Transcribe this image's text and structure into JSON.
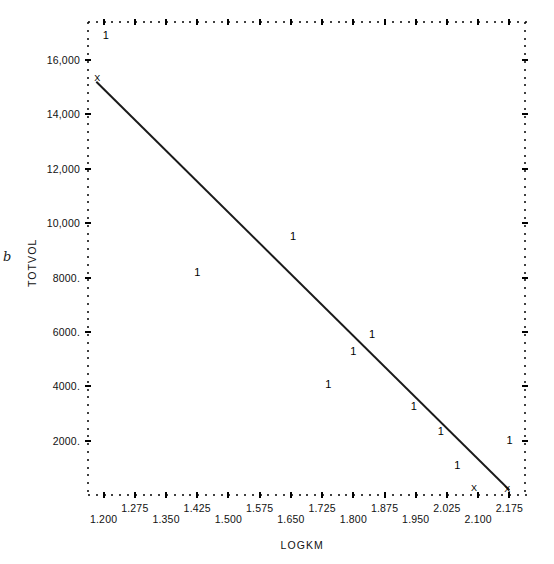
{
  "chart_data": {
    "type": "scatter",
    "title": "",
    "xlabel": "LOGKM",
    "ylabel": "TOTVOL",
    "xlim": [
      1.1625,
      2.2125
    ],
    "ylim": [
      0,
      17400
    ],
    "grid": false,
    "legend": null,
    "point_symbol": "1",
    "overlap_symbol": "X",
    "corner_label": "b",
    "xtick_labels": [
      "1.200",
      "1.275",
      "1.350",
      "1.425",
      "1.500",
      "1.575",
      "1.650",
      "1.725",
      "1.800",
      "1.875",
      "1.950",
      "2.025",
      "2.100",
      "2.175"
    ],
    "xtick_values": [
      1.2,
      1.275,
      1.35,
      1.425,
      1.5,
      1.575,
      1.65,
      1.725,
      1.8,
      1.875,
      1.95,
      2.025,
      2.1,
      2.175
    ],
    "ytick_labels": [
      "16,000",
      "14,000",
      "12,000",
      "10,000",
      "8000.",
      "6000.",
      "4000.",
      "2000."
    ],
    "ytick_values": [
      16000,
      14000,
      12000,
      10000,
      8000,
      6000,
      4000,
      2000
    ],
    "points": [
      {
        "x": 1.205,
        "y": 16900,
        "label": "1"
      },
      {
        "x": 1.185,
        "y": 15250,
        "label": "X"
      },
      {
        "x": 1.425,
        "y": 8150,
        "label": "1"
      },
      {
        "x": 1.655,
        "y": 9500,
        "label": "1"
      },
      {
        "x": 1.74,
        "y": 4050,
        "label": "1"
      },
      {
        "x": 1.8,
        "y": 5250,
        "label": "1"
      },
      {
        "x": 1.845,
        "y": 5900,
        "label": "1"
      },
      {
        "x": 1.945,
        "y": 3250,
        "label": "1"
      },
      {
        "x": 2.01,
        "y": 2300,
        "label": "1"
      },
      {
        "x": 2.05,
        "y": 1050,
        "label": "1"
      },
      {
        "x": 2.09,
        "y": 200,
        "label": "X"
      },
      {
        "x": 2.175,
        "y": 2000,
        "label": "1"
      },
      {
        "x": 2.17,
        "y": 150,
        "label": "X"
      }
    ],
    "fit_line": {
      "type": "linear",
      "x_start": 1.1825,
      "y_start": 15200,
      "x_end": 2.175,
      "y_end": 180
    }
  },
  "axes": {
    "plot_left_px": 88,
    "plot_right_px": 525,
    "plot_top_px": 22,
    "plot_bottom_px": 495
  }
}
